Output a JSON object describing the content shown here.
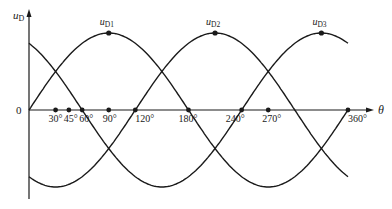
{
  "diagram": {
    "y_axis": {
      "label_main": "u",
      "label_sub": "D"
    },
    "x_axis": {
      "label": "θ",
      "origin_label": "0"
    },
    "curves": [
      {
        "name": "u_D1",
        "label_main": "u",
        "label_sub": "D1",
        "phase_deg": 0,
        "peak_deg": 90
      },
      {
        "name": "u_D2",
        "label_main": "u",
        "label_sub": "D2",
        "phase_deg": 120,
        "peak_deg": 210
      },
      {
        "name": "u_D3",
        "label_main": "u",
        "label_sub": "D3",
        "phase_deg": 240,
        "peak_deg": 330
      }
    ],
    "theta_range_deg": [
      0,
      360
    ],
    "ticks": [
      {
        "deg": 30,
        "label": "30°"
      },
      {
        "deg": 45,
        "label": "45°"
      },
      {
        "deg": 60,
        "label": "60°"
      },
      {
        "deg": 90,
        "label": "90°"
      },
      {
        "deg": 120,
        "label": "120°"
      },
      {
        "deg": 180,
        "label": "180°"
      },
      {
        "deg": 240,
        "label": "240°"
      },
      {
        "deg": 270,
        "label": "270°"
      },
      {
        "deg": 360,
        "label": "360°"
      }
    ],
    "colors": {
      "line": "#1a1a1a",
      "background": "#ffffff"
    }
  }
}
